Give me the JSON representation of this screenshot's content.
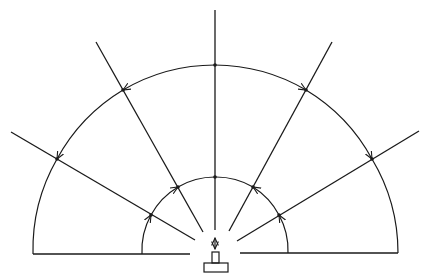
{
  "diagram": {
    "width": 429,
    "height": 279,
    "stroke_color": "#1a1a1a",
    "background": "#ffffff",
    "center": [
      215,
      250
    ],
    "outer_radius": 182,
    "inner_radius": 73,
    "rays": [
      {
        "name": "ray-far-left",
        "from": [
          11,
          132
        ],
        "to": [
          195,
          240
        ]
      },
      {
        "name": "ray-upper-left",
        "from": [
          96,
          42
        ],
        "to": [
          203,
          232
        ]
      },
      {
        "name": "ray-vertical",
        "from": [
          215,
          10
        ],
        "to": [
          215,
          230
        ]
      },
      {
        "name": "ray-upper-right",
        "from": [
          332,
          42
        ],
        "to": [
          229,
          231
        ]
      },
      {
        "name": "ray-far-right",
        "from": [
          419,
          131
        ],
        "to": [
          237,
          241
        ]
      }
    ],
    "outer_points": [
      [
        57,
        159
      ],
      [
        123,
        90
      ],
      [
        215,
        65
      ],
      [
        306,
        90
      ],
      [
        372,
        159
      ]
    ],
    "inner_points": [
      [
        151,
        215
      ],
      [
        178,
        187
      ],
      [
        215,
        177
      ],
      [
        253,
        187
      ],
      [
        279,
        215
      ]
    ],
    "baselines": [
      {
        "from": [
          33,
          254
        ],
        "to": [
          190,
          254
        ]
      },
      {
        "from": [
          240,
          253
        ],
        "to": [
          398,
          253
        ]
      }
    ],
    "source": {
      "base": {
        "x": 204,
        "y": 263,
        "w": 24,
        "h": 9
      },
      "knob": {
        "x": 212,
        "y": 252,
        "w": 7,
        "h": 11
      },
      "double_arrow": {
        "x": 215,
        "y1": 238,
        "y2": 249
      }
    }
  }
}
